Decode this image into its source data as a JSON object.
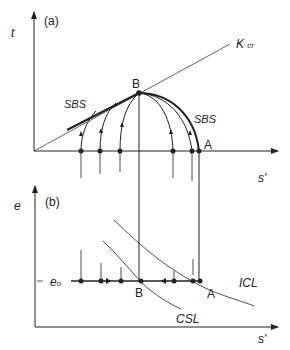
{
  "panel_a": {
    "tag": "(a)",
    "y_axis_label": "t",
    "x_axis_label": "s'",
    "line_label": "K",
    "line_label_sub": "cr",
    "point_b": "B",
    "point_a": "A",
    "sbs_left": "SBS",
    "sbs_right": "SBS"
  },
  "panel_b": {
    "tag": "(b)",
    "y_axis_label": "e",
    "x_axis_label": "s'",
    "e0_label": "e",
    "e0_sub": "o",
    "point_b": "B",
    "point_a": "A",
    "icl_label": "ICL",
    "csl_label": "CSL"
  },
  "colors": {
    "ink": "#222222",
    "background": "#ffffff"
  }
}
